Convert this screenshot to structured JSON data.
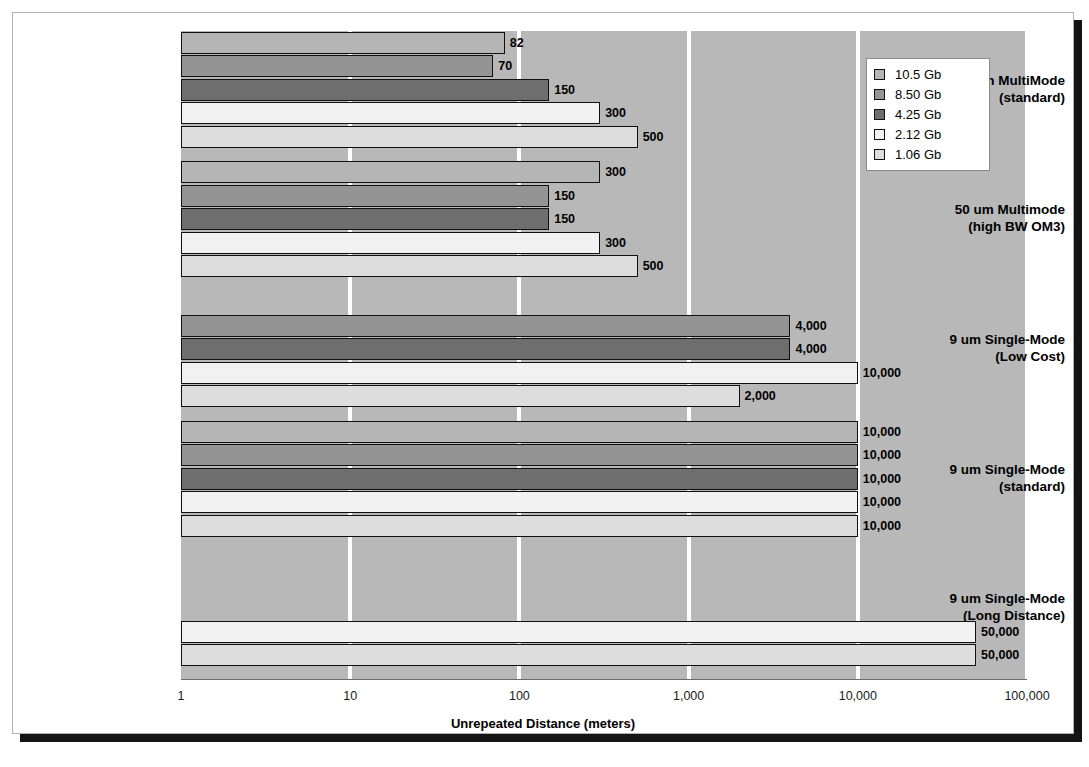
{
  "chart_data": {
    "type": "bar",
    "orientation": "horizontal",
    "title": "",
    "xlabel": "Unrepeated Distance (meters)",
    "ylabel": "",
    "xscale": "log",
    "xlim": [
      1,
      100000
    ],
    "xticks": [
      1,
      10,
      100,
      1000,
      10000,
      100000
    ],
    "xticklabels": [
      "1",
      "10",
      "100",
      "1,000",
      "10,000",
      "100,000"
    ],
    "grid": true,
    "grid_color": "#ffffff",
    "plot_background": "#b8b8b8",
    "legend_position": "top-right",
    "categories": [
      "50 um MultiMode (standard)",
      "50 um  Multimode (high BW OM3)",
      "9 um Single-Mode (Low Cost)",
      "9 um Single-Mode (standard)",
      "9 um Single-Mode (Long Distance)"
    ],
    "category_lines": [
      [
        "50 um MultiMode",
        "(standard)"
      ],
      [
        "50 um  Multimode",
        "(high BW OM3)"
      ],
      [
        "9 um Single-Mode",
        "(Low Cost)"
      ],
      [
        "9 um Single-Mode",
        "(standard)"
      ],
      [
        "9 um Single-Mode",
        "(Long Distance)"
      ]
    ],
    "series": [
      {
        "name": "10.5 Gb",
        "color": "#b5b5b5",
        "values": [
          82,
          300,
          null,
          10000,
          null
        ],
        "labels": [
          "82",
          "300",
          "",
          "10,000",
          ""
        ]
      },
      {
        "name": "8.50 Gb",
        "color": "#949494",
        "values": [
          70,
          150,
          4000,
          10000,
          null
        ],
        "labels": [
          "70",
          "150",
          "4,000",
          "10,000",
          ""
        ]
      },
      {
        "name": "4.25 Gb",
        "color": "#6e6e6e",
        "values": [
          150,
          150,
          4000,
          10000,
          null
        ],
        "labels": [
          "150",
          "150",
          "4,000",
          "10,000",
          ""
        ]
      },
      {
        "name": "2.12 Gb",
        "color": "#f1f1f1",
        "values": [
          300,
          300,
          10000,
          10000,
          50000
        ],
        "labels": [
          "300",
          "300",
          "10,000",
          "10,000",
          "50,000"
        ]
      },
      {
        "name": "1.06 Gb",
        "color": "#dddddd",
        "values": [
          500,
          500,
          2000,
          10000,
          50000
        ],
        "labels": [
          "500",
          "500",
          "2,000",
          "10,000",
          "50,000"
        ]
      }
    ]
  },
  "legend": {
    "items": [
      {
        "label": "10.5 Gb",
        "color": "#b5b5b5"
      },
      {
        "label": "8.50 Gb",
        "color": "#949494"
      },
      {
        "label": "4.25 Gb",
        "color": "#6e6e6e"
      },
      {
        "label": "2.12 Gb",
        "color": "#f1f1f1"
      },
      {
        "label": "1.06 Gb",
        "color": "#dddddd"
      }
    ]
  }
}
